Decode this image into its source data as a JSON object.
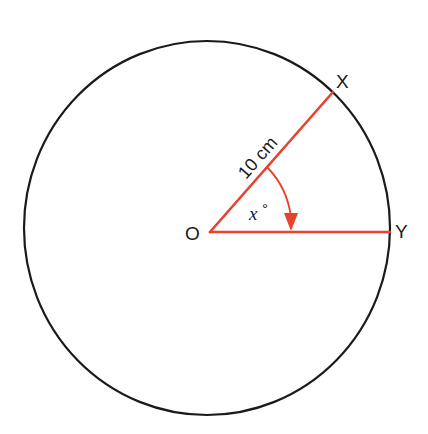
{
  "diagram": {
    "type": "circle-sector",
    "colors": {
      "circle": "#1a1a1a",
      "radius_lines": "#e8412c",
      "arrow": "#e8412c",
      "text": "#1a1a1a",
      "background": "#ffffff"
    },
    "points": {
      "center": {
        "label": "O"
      },
      "point_x": {
        "label": "X"
      },
      "point_y": {
        "label": "Y"
      }
    },
    "radius_label": "10 cm",
    "angle_label": "x",
    "angle_unit_symbol": "°"
  }
}
